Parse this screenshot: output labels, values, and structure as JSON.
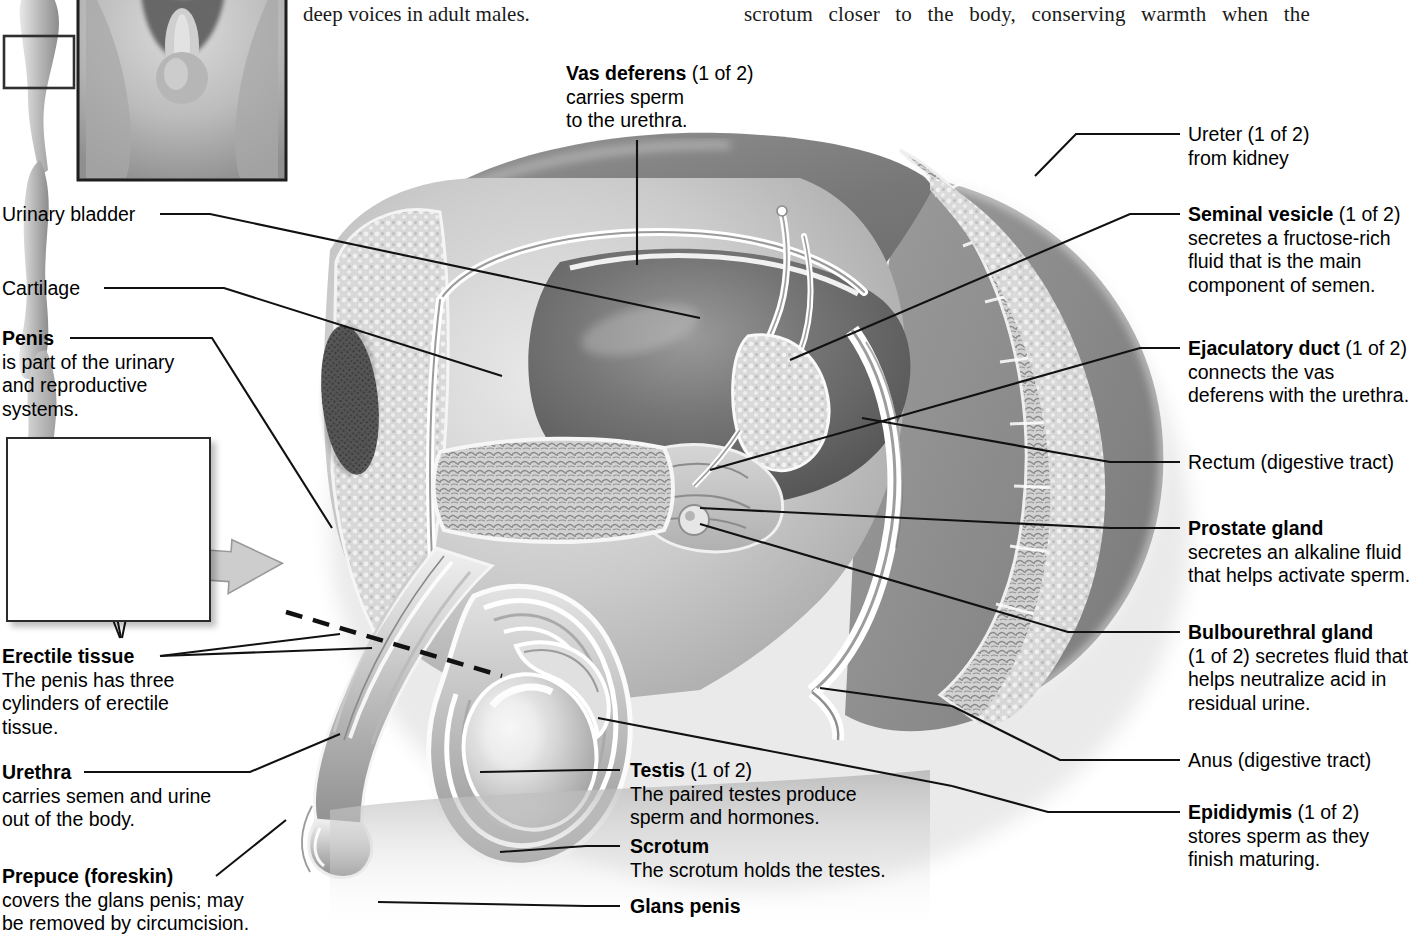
{
  "page": {
    "width": 1428,
    "height": 935,
    "background": "#ffffff",
    "line_color": "#111111",
    "figure_title": "Male reproductive system, sagittal section"
  },
  "body_text": {
    "left_column_line": "deep voices in adult males.",
    "right_column_line": "scrotum closer to the body, conserving warmth when the"
  },
  "insets": {
    "body_silhouette": {
      "name": "side-view male body silhouette with locator box",
      "locator_box": "pelvic region"
    },
    "anterior_view": {
      "name": "anterior view of male external genitalia, photographic"
    },
    "cross_section": {
      "name": "penis cross-section showing three cylinders of erectile tissue",
      "arrow": "callout arrow pointing from cross-section to penis shaft"
    }
  },
  "labels": {
    "vas_deferens": {
      "title": "Vas deferens",
      "qualifier": " (1 of 2)",
      "body": "carries sperm\nto the urethra."
    },
    "ureter": {
      "title": "Ureter (1 of 2)",
      "qualifier": "",
      "body": "from kidney",
      "bold": false
    },
    "seminal_vesicle": {
      "title": "Seminal vesicle",
      "qualifier": " (1 of 2)",
      "body": "secretes a fructose-rich\nfluid that is the main\ncomponent of semen."
    },
    "ejaculatory_duct": {
      "title": "Ejaculatory duct",
      "qualifier": " (1 of 2)",
      "body": "connects the vas\ndeferens with the urethra."
    },
    "rectum": {
      "title": "Rectum (digestive tract)",
      "qualifier": "",
      "body": "",
      "bold": false
    },
    "prostate_gland": {
      "title": "Prostate gland",
      "qualifier": "",
      "body": "secretes an alkaline fluid\nthat helps activate sperm."
    },
    "bulbourethral_gland": {
      "title": "Bulbourethral gland",
      "qualifier": "",
      "body": "(1 of 2) secretes fluid that\nhelps neutralize acid in\nresidual urine."
    },
    "anus": {
      "title": "Anus (digestive tract)",
      "qualifier": "",
      "body": "",
      "bold": false
    },
    "epididymis": {
      "title": "Epididymis",
      "qualifier": " (1 of 2)",
      "body": "stores sperm as they\nfinish maturing."
    },
    "urinary_bladder": {
      "title": "Urinary bladder",
      "qualifier": "",
      "body": "",
      "bold": false
    },
    "cartilage": {
      "title": "Cartilage",
      "qualifier": "",
      "body": "",
      "bold": false
    },
    "penis": {
      "title": "Penis",
      "qualifier": "",
      "body": "is part of the urinary\nand reproductive\nsystems."
    },
    "erectile_tissue": {
      "title": "Erectile tissue",
      "qualifier": "",
      "body": "The penis has three\ncylinders of erectile\ntissue."
    },
    "urethra": {
      "title": "Urethra",
      "qualifier": "",
      "body": "carries semen and urine\nout of the body."
    },
    "prepuce": {
      "title": "Prepuce (foreskin)",
      "qualifier": "",
      "body": "covers the glans penis; may\nbe removed by circumcision."
    },
    "testis": {
      "title": "Testis",
      "qualifier": " (1 of 2)",
      "body": "The paired testes produce\nsperm and hormones."
    },
    "scrotum": {
      "title": "Scrotum",
      "qualifier": "",
      "body": "The scrotum holds the testes."
    },
    "glans_penis": {
      "title": "Glans penis",
      "qualifier": "",
      "body": ""
    }
  }
}
